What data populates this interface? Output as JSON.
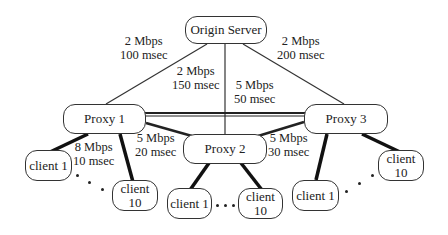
{
  "nodes": {
    "origin": "Origin Server",
    "proxy1": "Proxy 1",
    "proxy2": "Proxy 2",
    "proxy3": "Proxy 3",
    "p1_client1": "client 1",
    "p1_client10": "client 10",
    "p2_client1": "client 1",
    "p2_client10": "client 10",
    "p3_client1": "client 1",
    "p3_client10": "client 10"
  },
  "links": {
    "origin_p1": {
      "bw": "2 Mbps",
      "delay": "100 msec"
    },
    "origin_p2": {
      "bw": "2 Mbps",
      "delay": "150 msec"
    },
    "origin_p3": {
      "bw": "2 Mbps",
      "delay": "200 msec"
    },
    "proxy_backbone": {
      "bw": "5 Mbps",
      "delay": "50 msec"
    },
    "p1_p2": {
      "bw": "5 Mbps",
      "delay": "20 msec"
    },
    "p2_p3": {
      "bw": "5 Mbps",
      "delay": "30 msec"
    },
    "p1_clients": {
      "bw": "8 Mbps",
      "delay": "10 msec"
    }
  },
  "ellipsis": "..."
}
